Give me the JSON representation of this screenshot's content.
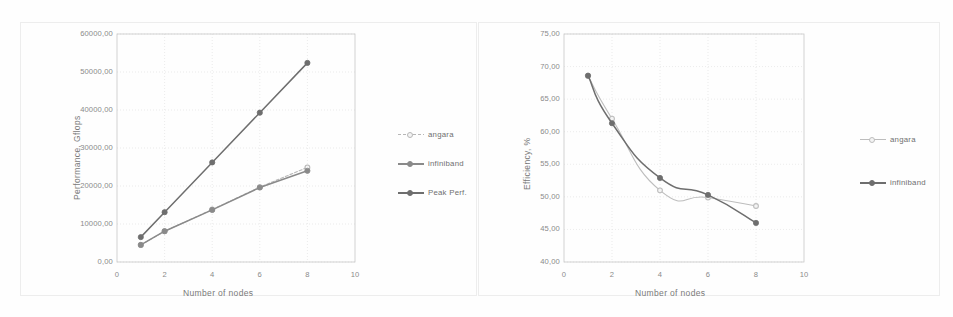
{
  "figure": {
    "background": "#fefefe",
    "panel_count": 2
  },
  "chart_data": [
    {
      "id": "performance",
      "type": "line",
      "title": "",
      "xlabel": "Number of nodes",
      "ylabel": "Performance, Gflops",
      "x": [
        1,
        2,
        4,
        6,
        8
      ],
      "xlim": [
        0,
        10
      ],
      "xticks": [
        "0",
        "2",
        "4",
        "6",
        "8",
        "10"
      ],
      "xtick_values": [
        0,
        2,
        4,
        6,
        8,
        10
      ],
      "ylim": [
        0,
        60000
      ],
      "yticks": [
        "0,00",
        "10000,00",
        "20000,00",
        "30000,00",
        "40000,00",
        "50000,00",
        "60000,00"
      ],
      "ytick_values": [
        0,
        10000,
        20000,
        30000,
        40000,
        50000,
        60000
      ],
      "grid": true,
      "legend_position": "right",
      "series": [
        {
          "name": "angara",
          "values": [
            4500,
            8100,
            13800,
            19700,
            24900
          ],
          "color": "#b7b7b7",
          "marker": "circle-open",
          "style": "dashed"
        },
        {
          "name": "infiniband",
          "values": [
            4500,
            8100,
            13700,
            19600,
            24000
          ],
          "color": "#8a8a8a",
          "marker": "circle",
          "style": "solid"
        },
        {
          "name": "Peak Perf.",
          "values": [
            6550,
            13100,
            26200,
            39300,
            52400
          ],
          "color": "#6e6e6e",
          "marker": "circle",
          "style": "solid"
        }
      ]
    },
    {
      "id": "efficiency",
      "type": "line",
      "title": "",
      "xlabel": "Number of nodes",
      "ylabel": "Efficiency, %",
      "x": [
        1,
        2,
        4,
        6,
        8
      ],
      "xlim": [
        0,
        10
      ],
      "xticks": [
        "0",
        "2",
        "4",
        "6",
        "8",
        "10"
      ],
      "xtick_values": [
        0,
        2,
        4,
        6,
        8,
        10
      ],
      "ylim": [
        40,
        75
      ],
      "yticks": [
        "40,00",
        "45,00",
        "50,00",
        "55,00",
        "60,00",
        "65,00",
        "70,00",
        "75,00"
      ],
      "ytick_values": [
        40,
        45,
        50,
        55,
        60,
        65,
        70,
        75
      ],
      "grid": true,
      "legend_position": "right",
      "series": [
        {
          "name": "angara",
          "values": [
            68.6,
            62.0,
            51.0,
            49.9,
            48.6
          ],
          "color": "#bdbdbd",
          "marker": "circle-open",
          "style": "solid-light"
        },
        {
          "name": "infiniband",
          "values": [
            68.6,
            61.3,
            52.9,
            50.3,
            46.0
          ],
          "color": "#6e6e6e",
          "marker": "circle",
          "style": "solid"
        }
      ]
    }
  ],
  "colors": {
    "grid": "#e3e3e3",
    "axis": "#c9c9c9",
    "text": "#7a7a7a",
    "frame": "#ededed"
  }
}
